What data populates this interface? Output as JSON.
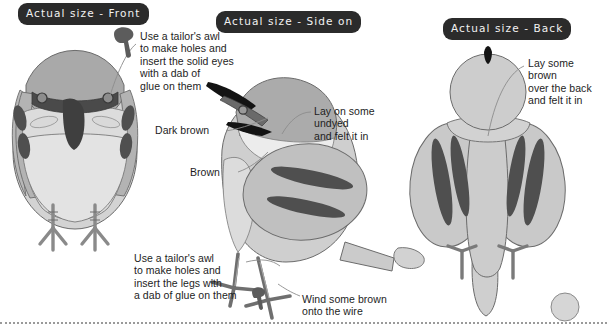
{
  "page": {
    "background": "#ffffff"
  },
  "colors": {
    "badge_bg": "#2b2b2b",
    "badge_text": "#f2f2f2",
    "body_light": "#d9d9d9",
    "body_mid": "#c2c2c2",
    "body_dark": "#8f8f8f",
    "marking_dark": "#4d4d4d",
    "beak_black": "#111111",
    "outline": "#5a5a5a",
    "note_text": "#1d1d1d",
    "leader_line": "#8c8c8c",
    "dotted_rule": "#9a9a9a"
  },
  "badges": [
    {
      "id": "front",
      "label": "Actual size - Front"
    },
    {
      "id": "side",
      "label": "Actual size - Side on"
    },
    {
      "id": "back",
      "label": "Actual size - Back"
    }
  ],
  "views": [
    {
      "id": "front-view",
      "name": "Front view of felted bird"
    },
    {
      "id": "side-view",
      "name": "Side-on view of felted bird"
    },
    {
      "id": "back-view",
      "name": "Back view of felted bird"
    }
  ],
  "notes": [
    {
      "id": "eyes",
      "text": "Use a tailor's awl\nto make holes and\ninsert the solid eyes\nwith a dab of\nglue on them",
      "icon": "awl-icon"
    },
    {
      "id": "undyed",
      "text": "Lay on some\nundyed\nand felt it in"
    },
    {
      "id": "dark-brown",
      "text": "Dark brown"
    },
    {
      "id": "brown",
      "text": "Brown"
    },
    {
      "id": "legs",
      "text": "Use a tailor's awl\nto make holes and\ninsert the legs with\na dab of glue on them",
      "icon": "awl-icon"
    },
    {
      "id": "wire",
      "text": "Wind some brown\nonto the wire"
    },
    {
      "id": "back",
      "text": "Lay some\nbrown\nover the back\nand felt it in"
    }
  ],
  "footer": {
    "rule_style": "dotted"
  }
}
